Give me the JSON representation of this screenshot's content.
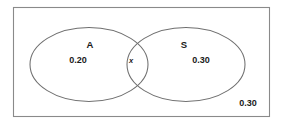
{
  "figure": {
    "type": "venn-diagram",
    "colors": {
      "background": "#ffffff",
      "rectangle_stroke": "#8a8a8a",
      "ellipse_stroke": "#6f6f6f",
      "text": "#1a1a1a"
    }
  },
  "universe": {
    "outside_label": "0.30"
  },
  "sets": [
    {
      "name": "A",
      "value": "0.20"
    },
    {
      "name": "S",
      "value": "0.30"
    }
  ],
  "intersection": {
    "label": "x"
  }
}
